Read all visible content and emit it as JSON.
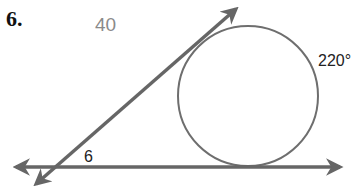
{
  "problem": {
    "number": "6."
  },
  "labels": {
    "answer_value": "40",
    "arc_measure": "220°",
    "angle_label": "6"
  },
  "colors": {
    "line": "#666666",
    "circle": "#6e6e6e",
    "answer_text": "#8a8a8a",
    "text": "#111111"
  },
  "figure": {
    "type": "circle with tangent and secant-like lines",
    "circle": {
      "cx": 248,
      "cy": 96,
      "r": 70
    },
    "horizontal_tangent": {
      "y": 167,
      "x1": 12,
      "x2": 344
    },
    "diagonal_tangent": {
      "x1": 32,
      "y1": 188,
      "x2": 240,
      "y2": 6
    }
  }
}
